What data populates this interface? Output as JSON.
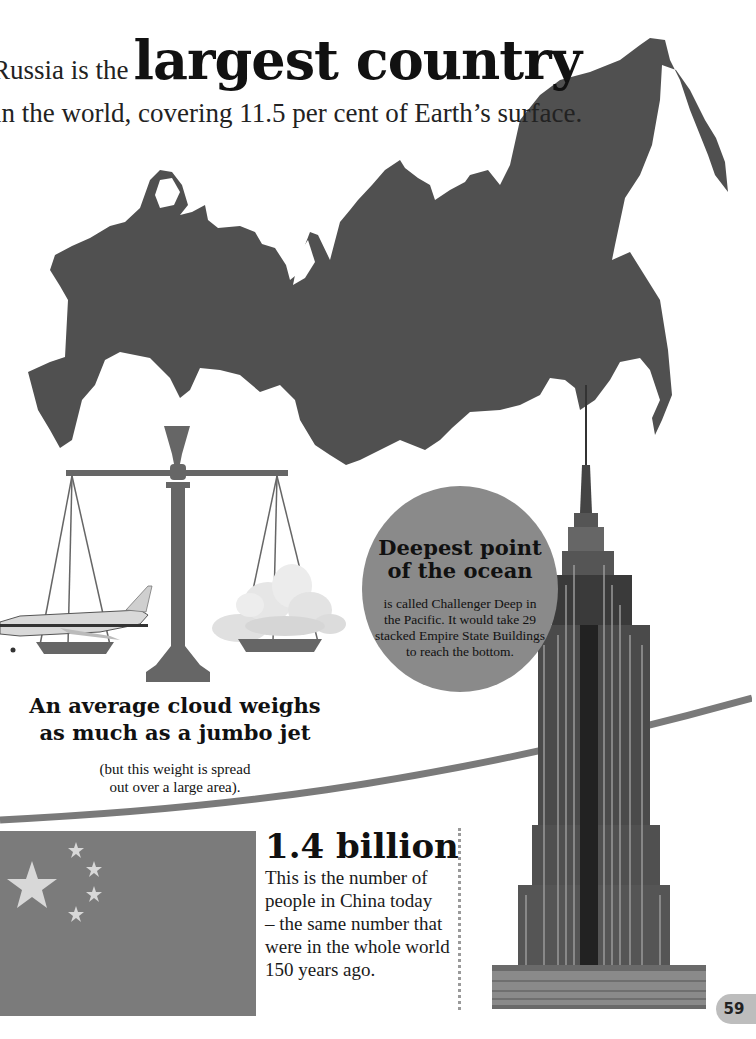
{
  "headline": {
    "prefix": "Russia is the",
    "emphasis": "largest country",
    "subline": "in the world, covering 11.5 per cent of Earth’s surface."
  },
  "ocean_fact": {
    "title_line1": "Deepest point",
    "title_line2": "of the ocean",
    "body_line1": "is called Challenger Deep in",
    "body_line2": "the Pacific. It would take 29",
    "body_line3": "stacked Empire State Buildings",
    "body_line4": "to reach the bottom."
  },
  "cloud_fact": {
    "title_line1": "An average cloud weighs",
    "title_line2": "as much as a jumbo jet",
    "body_line1": "(but this weight is spread",
    "body_line2": "out over a large area)."
  },
  "china_fact": {
    "number": "1.4 billion",
    "body_line1": "This is the number of",
    "body_line2": "people in China today",
    "body_line3": "– the same number that",
    "body_line4": "were in the whole world",
    "body_line5": "150 years ago."
  },
  "page": {
    "number": "59"
  },
  "colors": {
    "map_fill": "#505050",
    "scale_fill": "#666666",
    "circle_fill": "#8a8a8a",
    "flag_fill": "#7b7b7b",
    "stripe": "#7a7a7a",
    "page_tab": "#bdbdbd"
  }
}
